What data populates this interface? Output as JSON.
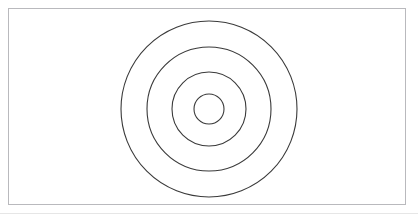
{
  "figure": {
    "canvas": {
      "width": 418,
      "height": 221,
      "background_color": "#ffffff"
    },
    "frame": {
      "name": "figure-border",
      "x": 8,
      "y": 8,
      "width": 398,
      "height": 197,
      "stroke_color": "#b9b9bd",
      "stroke_width": 1,
      "fill_color": "#ffffff"
    },
    "page_edge": {
      "name": "scan-page-edge",
      "y": 213,
      "stroke_color": "#e6e6e6",
      "stroke_width": 1
    },
    "center": {
      "cx": 209,
      "cy": 109
    },
    "stroke_color": "#3a3a3a",
    "stroke_width": 1.1,
    "fill": "none",
    "ring_count": 4,
    "rings": [
      {
        "name": "ring-outer",
        "index": 1,
        "label": "Outer circle",
        "cx": 209,
        "cy": 109,
        "r": 88,
        "diameter": 176,
        "stroke_color": "#3a3a3a",
        "stroke_width": 1.1
      },
      {
        "name": "ring-second",
        "index": 2,
        "label": "Second circle",
        "cx": 209,
        "cy": 109,
        "r": 62,
        "diameter": 124,
        "stroke_color": "#3a3a3a",
        "stroke_width": 1.1
      },
      {
        "name": "ring-third",
        "index": 3,
        "label": "Third circle",
        "cx": 209,
        "cy": 109,
        "r": 37,
        "diameter": 74,
        "stroke_color": "#3a3a3a",
        "stroke_width": 1.1
      },
      {
        "name": "ring-inner",
        "index": 4,
        "label": "Inner circle",
        "cx": 209,
        "cy": 109,
        "r": 15,
        "diameter": 30,
        "stroke_color": "#3a3a3a",
        "stroke_width": 1.1
      }
    ]
  }
}
